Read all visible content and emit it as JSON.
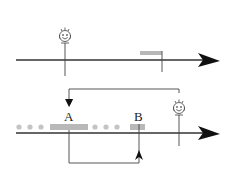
{
  "diagram": {
    "colors": {
      "line": "#333333",
      "bar": "#b8b8b8",
      "dot": "#c4c4c4",
      "face": "#555555"
    },
    "top_timeline": {
      "person_icon": "smiley-face-icon",
      "event_marker": "gray-bar"
    },
    "bottom_timeline": {
      "labels": {
        "a": "A",
        "b": "B"
      },
      "person_icon": "smiley-face-icon",
      "dots_left": 3,
      "dots_middle": 3
    }
  }
}
